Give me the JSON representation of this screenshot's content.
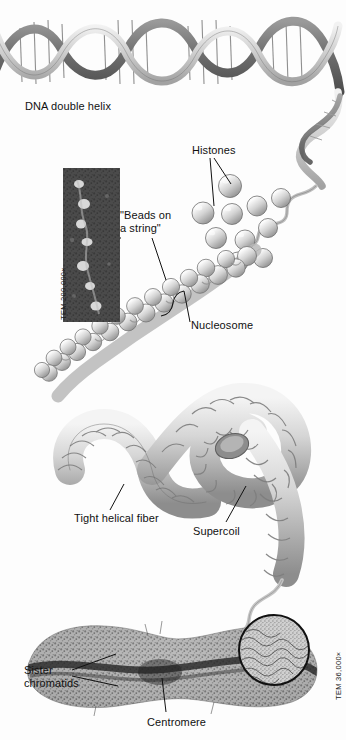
{
  "figure": {
    "background_color": "#fdfdfd",
    "ink_color": "#111111",
    "width": 346,
    "height": 740
  },
  "labels": {
    "dna_double_helix": "DNA double helix",
    "histones": "Histones",
    "beads_on_a_string": "\"Beads on\na string\"",
    "nucleosome": "Nucleosome",
    "tight_helical_fiber": "Tight helical fiber",
    "supercoil": "Supercoil",
    "sister_chromatids": "Sister\nchromatids",
    "centromere": "Centromere"
  },
  "micrographs": {
    "beads_on_string": {
      "magnification": "TEM 200,000×",
      "orientation": "vertical"
    },
    "chromosome": {
      "magnification": "TEM 36,000×",
      "orientation": "vertical"
    }
  },
  "structures": [
    {
      "name": "dna-double-helix",
      "stage": 1
    },
    {
      "name": "histone-proteins",
      "stage": 2
    },
    {
      "name": "beads-on-a-string-nucleosomes",
      "stage": 3
    },
    {
      "name": "tight-helical-fiber",
      "stage": 4
    },
    {
      "name": "supercoil",
      "stage": 5
    },
    {
      "name": "metaphase-chromosome",
      "stage": 6
    }
  ]
}
